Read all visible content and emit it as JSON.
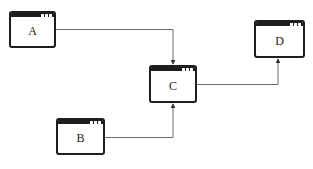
{
  "diagram": {
    "nodes": [
      {
        "id": "A",
        "label": "A",
        "x": 9,
        "y": 11,
        "w": 47,
        "h": 37
      },
      {
        "id": "B",
        "label": "B",
        "x": 56,
        "y": 118,
        "w": 49,
        "h": 37
      },
      {
        "id": "C",
        "label": "C",
        "x": 149,
        "y": 65,
        "w": 48,
        "h": 38
      },
      {
        "id": "D",
        "label": "D",
        "x": 254,
        "y": 20,
        "w": 51,
        "h": 38
      }
    ],
    "edges": [
      {
        "from": "A",
        "to": "C"
      },
      {
        "from": "B",
        "to": "C"
      },
      {
        "from": "C",
        "to": "D"
      }
    ],
    "colors": {
      "frame": "#1e1e1e",
      "edge": "#6a6a6a",
      "background": "#ffffff"
    }
  }
}
